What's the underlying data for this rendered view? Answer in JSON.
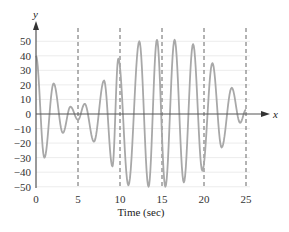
{
  "chart_data": {
    "type": "line",
    "title": "",
    "xlabel": "Time (sec)",
    "ylabel": "y",
    "x_axis_letter": "x",
    "xlim": [
      0,
      25
    ],
    "ylim": [
      -50,
      50
    ],
    "x_ticks": [
      0,
      5,
      10,
      15,
      20,
      25
    ],
    "y_ticks": [
      50,
      40,
      30,
      20,
      10,
      0,
      -10,
      -20,
      -30,
      -40,
      -50
    ],
    "x_tick_labels": [
      "0",
      "5",
      "10",
      "15",
      "20",
      "25"
    ],
    "y_tick_labels": [
      "50",
      "40",
      "30",
      "20",
      "10",
      "0",
      "−10",
      "−20",
      "−30",
      "−40",
      "−50"
    ],
    "vertical_dashed_lines": [
      5,
      10,
      15,
      20,
      25
    ],
    "horizontal_gridlines": true,
    "legend": null,
    "series": [
      {
        "name": "y(t)",
        "color": "#a8a8a8",
        "extrema": [
          {
            "t": 0.0,
            "y": 40
          },
          {
            "t": 1.0,
            "y": -30
          },
          {
            "t": 2.1,
            "y": 21
          },
          {
            "t": 3.2,
            "y": -13
          },
          {
            "t": 4.1,
            "y": 5
          },
          {
            "t": 5.0,
            "y": -4
          },
          {
            "t": 5.8,
            "y": 7
          },
          {
            "t": 6.9,
            "y": -19
          },
          {
            "t": 8.1,
            "y": 23
          },
          {
            "t": 9.1,
            "y": -36
          },
          {
            "t": 9.8,
            "y": 38
          },
          {
            "t": 11.0,
            "y": -49
          },
          {
            "t": 12.3,
            "y": 50
          },
          {
            "t": 13.4,
            "y": -50
          },
          {
            "t": 14.4,
            "y": 51
          },
          {
            "t": 15.4,
            "y": -50
          },
          {
            "t": 16.5,
            "y": 51
          },
          {
            "t": 17.6,
            "y": -47
          },
          {
            "t": 18.7,
            "y": 48
          },
          {
            "t": 19.8,
            "y": -39
          },
          {
            "t": 21.0,
            "y": 35
          },
          {
            "t": 22.1,
            "y": -23
          },
          {
            "t": 23.3,
            "y": 18
          },
          {
            "t": 24.3,
            "y": -6
          },
          {
            "t": 25.0,
            "y": 3
          }
        ]
      }
    ]
  },
  "colors": {
    "curve": "#a8a8a8",
    "axis": "#555555",
    "dashed": "#666666",
    "grid": "#ececec"
  }
}
